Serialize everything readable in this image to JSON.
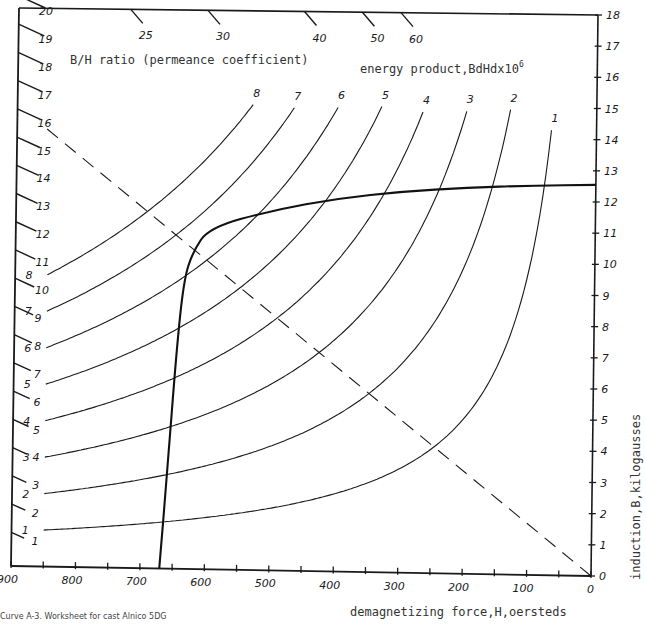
{
  "caption": "Curve A-3. Worksheet for cast Alnico 5DG",
  "chart_data": {
    "type": "line",
    "xlabel": "demagnetizing force,H,oersteds",
    "ylabel": "induction,B,kilogausses",
    "x_axis": {
      "range": [
        900,
        0
      ],
      "direction": "reversed",
      "tick_labels": [
        "900",
        "800",
        "700",
        "600",
        "500",
        "400",
        "300",
        "200",
        "100",
        "0"
      ],
      "minor_tick_step": 50
    },
    "y_axis_right": {
      "range": [
        0,
        18
      ],
      "tick_labels": [
        "0",
        "1",
        "2",
        "3",
        "4",
        "5",
        "6",
        "7",
        "8",
        "9",
        "10",
        "11",
        "12",
        "13",
        "14",
        "15",
        "16",
        "17",
        "18"
      ]
    },
    "left_scale": {
      "title": "B/H ratio (permeance coefficient)",
      "tick_labels": [
        "1",
        "2",
        "3",
        "4",
        "5",
        "6",
        "7",
        "8",
        "9",
        "10",
        "11",
        "12",
        "13",
        "14",
        "15",
        "16",
        "17",
        "18",
        "19",
        "20"
      ]
    },
    "top_scale": {
      "tick_labels": [
        "25",
        "30",
        "40",
        "50",
        "60"
      ]
    },
    "energy_product_label": "energy product,BdHdx10",
    "energy_product_label_sup": "6",
    "series": [
      {
        "name": "Demagnetization curve",
        "style": "bold",
        "points": [
          [
            670,
            0
          ],
          [
            660,
            3
          ],
          [
            648,
            7
          ],
          [
            638,
            9.3
          ],
          [
            625,
            10.2
          ],
          [
            600,
            11
          ],
          [
            500,
            11.6
          ],
          [
            400,
            12.0
          ],
          [
            300,
            12.25
          ],
          [
            200,
            12.4
          ],
          [
            100,
            12.5
          ],
          [
            0,
            12.55
          ]
        ]
      },
      {
        "name": "Load line (B/H ≈ 16)",
        "style": "dashed",
        "points": [
          [
            0,
            0
          ],
          [
            900,
            14.3
          ]
        ]
      },
      {
        "name": "BdHd = 1 x10^6",
        "label": "1",
        "style": "hyperbola",
        "product": 1
      },
      {
        "name": "BdHd = 2 x10^6",
        "label": "2",
        "style": "hyperbola",
        "product": 2
      },
      {
        "name": "BdHd = 3 x10^6",
        "label": "3",
        "style": "hyperbola",
        "product": 3
      },
      {
        "name": "BdHd = 4 x10^6",
        "label": "4",
        "style": "hyperbola",
        "product": 4
      },
      {
        "name": "BdHd = 5 x10^6",
        "label": "5",
        "style": "hyperbola",
        "product": 5
      },
      {
        "name": "BdHd = 6 x10^6",
        "label": "6",
        "style": "hyperbola",
        "product": 6
      },
      {
        "name": "BdHd = 7 x10^6",
        "label": "7",
        "style": "hyperbola",
        "product": 7
      },
      {
        "name": "BdHd = 8 x10^6",
        "label": "8",
        "style": "hyperbola",
        "product": 8
      }
    ],
    "energy_curve_labels": [
      "1",
      "2",
      "3",
      "4",
      "5",
      "6",
      "7",
      "8"
    ],
    "grid": false,
    "legend": "none"
  }
}
